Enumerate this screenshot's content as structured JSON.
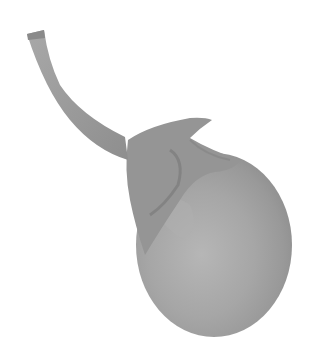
{
  "image": {
    "subject": "round eggplant with stem",
    "style": "grayscale photograph",
    "background": "#ffffff",
    "colors": {
      "body_light": "#b8b8b8",
      "body_mid": "#a2a2a2",
      "body_dark": "#8e8e8e",
      "stem": "#9a9a9a",
      "calyx": "#8a8a8a"
    }
  }
}
